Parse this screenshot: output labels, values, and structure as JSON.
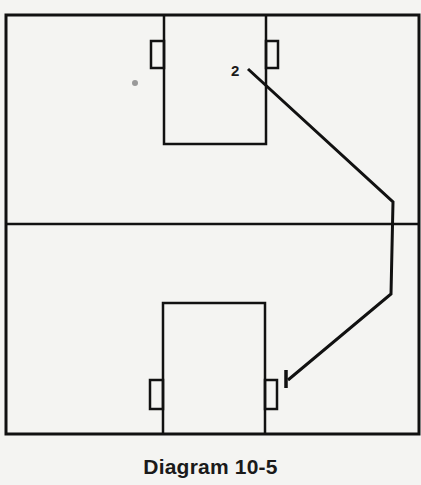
{
  "diagram": {
    "caption": "Diagram 10-5",
    "court": {
      "outer": {
        "x": 6,
        "y": 15,
        "width": 413,
        "height": 419
      },
      "center_line_y": 224
    },
    "top_box": {
      "x": 164,
      "y": 15,
      "width": 102,
      "height": 129,
      "left_tab": {
        "x": 151,
        "y": 41,
        "width": 13,
        "height": 27
      },
      "right_tab": {
        "x": 266,
        "y": 41,
        "width": 12,
        "height": 27
      }
    },
    "bottom_box": {
      "x": 163,
      "y": 303,
      "width": 102,
      "height": 131,
      "left_tab": {
        "x": 150,
        "y": 380,
        "width": 13,
        "height": 29
      },
      "right_tab": {
        "x": 265,
        "y": 380,
        "width": 12,
        "height": 29
      }
    },
    "player_label": "2",
    "path": {
      "points": [
        [
          248,
          69
        ],
        [
          393,
          202
        ],
        [
          391,
          294
        ],
        [
          288,
          380
        ]
      ],
      "end_marker": "tick"
    },
    "colors": {
      "line": "#111111",
      "background": "#f4f4f2"
    }
  }
}
